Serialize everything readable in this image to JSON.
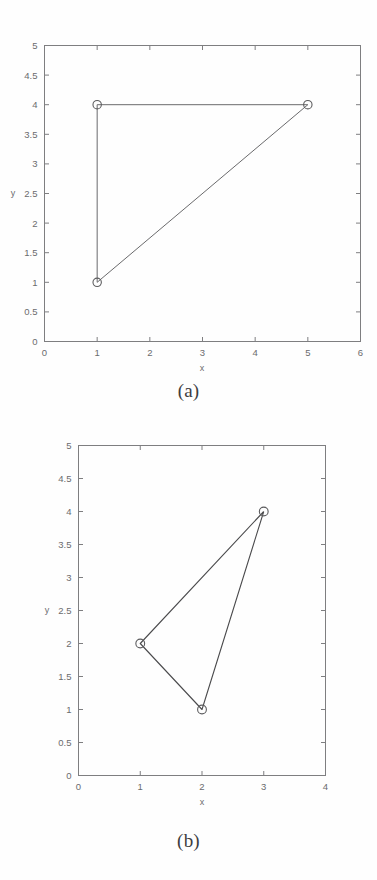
{
  "page": {
    "background": "#fefefe",
    "width": 377,
    "height": 880
  },
  "panels": [
    {
      "id": "a",
      "caption": "(a)",
      "xlabel": "x",
      "ylabel": "y"
    },
    {
      "id": "b",
      "caption": "(b)",
      "xlabel": "x",
      "ylabel": "y"
    }
  ],
  "chart_data": [
    {
      "type": "line",
      "id": "panel-a",
      "title": "(a)",
      "xlabel": "x",
      "ylabel": "y",
      "xlim": [
        0,
        6
      ],
      "ylim": [
        0,
        5
      ],
      "xticks": [
        0,
        1,
        2,
        3,
        4,
        5,
        6
      ],
      "xtick_labels": [
        "0",
        "1",
        "2",
        "3",
        "4",
        "5",
        "6"
      ],
      "yticks": [
        0,
        0.5,
        1,
        1.5,
        2,
        2.5,
        3,
        3.5,
        4,
        4.5,
        5
      ],
      "ytick_labels": [
        "0",
        "0.5",
        "1",
        "1.5",
        "2",
        "2.5",
        "3",
        "3.5",
        "4",
        "4.5",
        "5"
      ],
      "grid": false,
      "legend": null,
      "marker": "circle",
      "closed": true,
      "series": [
        {
          "name": "triangle",
          "x": [
            1,
            5,
            1,
            1
          ],
          "y": [
            4,
            4,
            1,
            4
          ],
          "points": [
            [
              1,
              4
            ],
            [
              5,
              4
            ],
            [
              1,
              1
            ]
          ]
        }
      ]
    },
    {
      "type": "line",
      "id": "panel-b",
      "title": "(b)",
      "xlabel": "x",
      "ylabel": "y",
      "xlim": [
        0,
        4
      ],
      "ylim": [
        0,
        5
      ],
      "xticks": [
        0,
        1,
        2,
        3,
        4
      ],
      "xtick_labels": [
        "0",
        "1",
        "2",
        "3",
        "4"
      ],
      "yticks": [
        0,
        0.5,
        1,
        1.5,
        2,
        2.5,
        3,
        3.5,
        4,
        4.5,
        5
      ],
      "ytick_labels": [
        "0",
        "0.5",
        "1",
        "1.5",
        "2",
        "2.5",
        "3",
        "3.5",
        "4",
        "4.5",
        "5"
      ],
      "grid": false,
      "legend": null,
      "marker": "circle",
      "closed": true,
      "series": [
        {
          "name": "triangle",
          "x": [
            3,
            1,
            2,
            3
          ],
          "y": [
            4,
            2,
            1,
            4
          ],
          "points": [
            [
              3,
              4
            ],
            [
              1,
              2
            ],
            [
              2,
              1
            ]
          ]
        }
      ]
    }
  ],
  "colors": {
    "axis": "#7e7e80",
    "line": "#6a6a6c",
    "marker": "#5c5c5e",
    "text": "#6b6b6d",
    "caption": "#3d3d3f",
    "background": "#fefefe"
  }
}
